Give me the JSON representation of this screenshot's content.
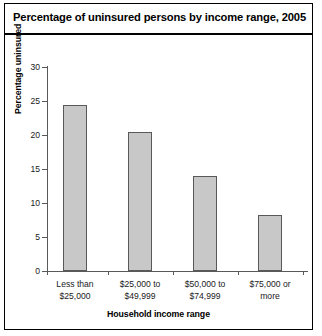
{
  "chart_data": {
    "type": "bar",
    "title": "Percentage of uninsured persons by income range, 2005",
    "xlabel": "Household income range",
    "ylabel": "Percentage uninsured",
    "categories": [
      "Less than\n$25,000",
      "$25,000 to\n$49,999",
      "$50,000 to\n$74,999",
      "$75,000 or\nmore"
    ],
    "category_lines": [
      [
        "Less than",
        "$25,000"
      ],
      [
        "$25,000 to",
        "$49,999"
      ],
      [
        "$50,000 to",
        "$74,999"
      ],
      [
        "$75,000 or",
        "more"
      ]
    ],
    "values": [
      24.4,
      20.5,
      14.0,
      8.3
    ],
    "ylim": [
      0,
      30
    ],
    "ytick_step": 5,
    "yticks": [
      0,
      5,
      10,
      15,
      20,
      25,
      30
    ],
    "ytick_labels": [
      "0",
      "5",
      "10",
      "15",
      "20",
      "25",
      "30"
    ],
    "grid": false,
    "legend": "none",
    "bar_fill_color": "#c8c8c8",
    "bar_border_color": "#595959",
    "axis_color": "#595959",
    "frame_color": "#000000",
    "background_color": "#ffffff"
  }
}
